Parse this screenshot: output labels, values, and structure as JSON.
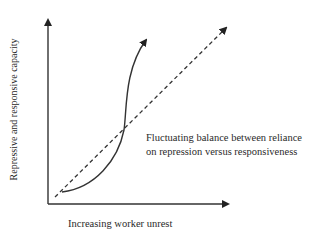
{
  "diagram": {
    "y_axis_label": "Repressive and responsive capacity",
    "x_axis_label": "Increasing worker unrest",
    "annotation_line1": "Fluctuating balance between reliance",
    "annotation_line2": "on repression versus responsiveness",
    "elements": [
      {
        "type": "solid-curve",
        "description": "S-shaped curve rising steeply, crossing the dashed line"
      },
      {
        "type": "dashed-line",
        "description": "straight diagonal trend line"
      }
    ]
  }
}
